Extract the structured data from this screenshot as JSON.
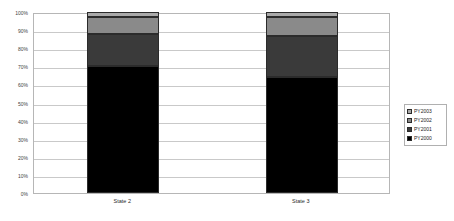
{
  "chart_data": {
    "type": "bar",
    "subtype": "stacked-percent-column",
    "title": "",
    "subtitle": "",
    "xlabel": "",
    "ylabel": "",
    "categories": [
      "State 2",
      "State 3"
    ],
    "series": [
      {
        "name": "PY2000",
        "values": [
          70,
          64
        ],
        "color": "#000000"
      },
      {
        "name": "PY2001",
        "values": [
          18,
          23
        ],
        "color": "#3a3a3a"
      },
      {
        "name": "PY2002",
        "values": [
          9,
          10
        ],
        "color": "#8a8a8a"
      },
      {
        "name": "PY2003",
        "values": [
          3,
          3
        ],
        "color": "#a9a9a9"
      }
    ],
    "stack_order_bottom_to_top": [
      "PY2000",
      "PY2001",
      "PY2002",
      "PY2003"
    ],
    "ylim": [
      0,
      100
    ],
    "y_tick_labels": [
      "0%",
      "10%",
      "20%",
      "30%",
      "40%",
      "50%",
      "60%",
      "70%",
      "80%",
      "90%",
      "100%"
    ],
    "y_tick_values": [
      0,
      10,
      20,
      30,
      40,
      50,
      60,
      70,
      80,
      90,
      100
    ],
    "grid": {
      "horizontal": true,
      "vertical": false
    },
    "legend": {
      "position": "right",
      "entries": [
        {
          "label": "PY2003",
          "color": "#a9a9a9"
        },
        {
          "label": "PY2002",
          "color": "#8a8a8a"
        },
        {
          "label": "PY2001",
          "color": "#3a3a3a"
        },
        {
          "label": "PY2000",
          "color": "#000000"
        }
      ]
    },
    "colors": {
      "plot_border": "#b6b6b6",
      "gridline": "#c9c9c9",
      "bar_border": "#2b2b2b",
      "background": "#ffffff",
      "axis_text": "#3f3f3f"
    }
  }
}
